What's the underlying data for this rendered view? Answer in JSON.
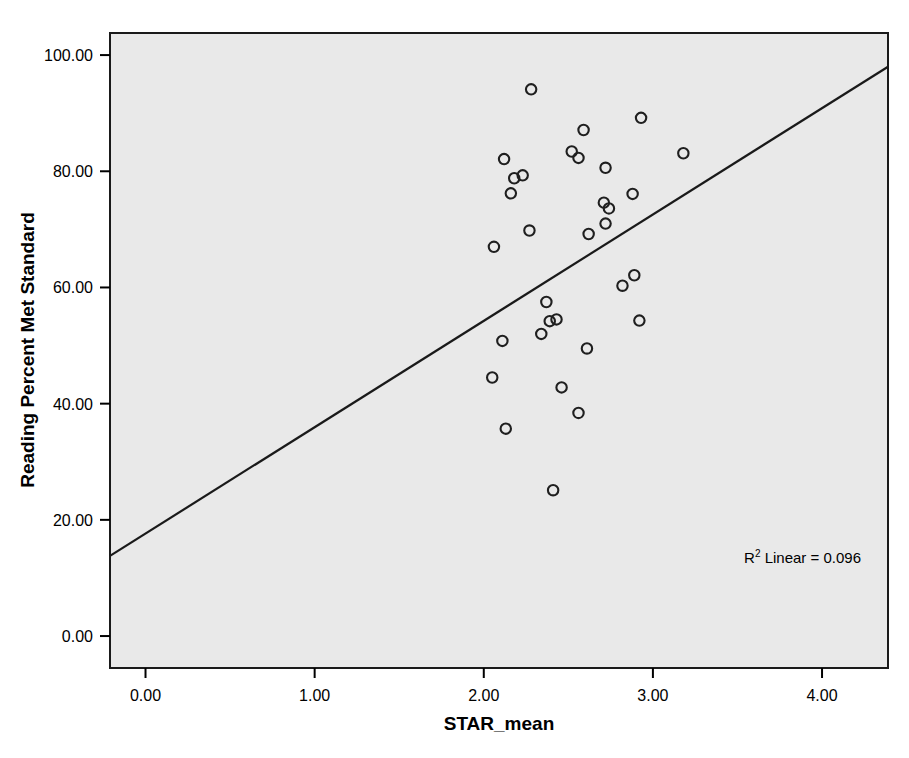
{
  "chart_data": {
    "type": "scatter",
    "title": "",
    "xlabel": "STAR_mean",
    "ylabel": "Reading Percent Met Standard",
    "xlim": [
      -0.21,
      4.39
    ],
    "ylim": [
      -5.5,
      103.8
    ],
    "xticks": [
      "0.00",
      "1.00",
      "2.00",
      "3.00",
      "4.00"
    ],
    "xtick_values": [
      0,
      1,
      2,
      3,
      4
    ],
    "yticks": [
      "0.00",
      "20.00",
      "40.00",
      "60.00",
      "80.00",
      "100.00"
    ],
    "ytick_values": [
      0,
      20,
      40,
      60,
      80,
      100
    ],
    "grid": false,
    "legend": false,
    "annotation": "R² Linear = 0.096",
    "annotation_base": "R",
    "annotation_sup": "2",
    "annotation_rest": " Linear = 0.096",
    "r_squared": 0.096,
    "marker_style": "open-circle",
    "plot_background": "#e9e9e9",
    "marker_color": "#1f1f1f",
    "fitline_color": "#1a1a1a",
    "fit_line": {
      "x0": -0.21,
      "y0": 13.8,
      "x1": 4.39,
      "y1": 98.0,
      "slope": 18.3,
      "intercept": 17.6
    },
    "points": [
      {
        "x": 2.28,
        "y": 94.1
      },
      {
        "x": 2.59,
        "y": 87.1
      },
      {
        "x": 2.93,
        "y": 89.2
      },
      {
        "x": 2.52,
        "y": 83.4
      },
      {
        "x": 2.56,
        "y": 82.3
      },
      {
        "x": 2.12,
        "y": 82.1
      },
      {
        "x": 3.18,
        "y": 83.1
      },
      {
        "x": 2.72,
        "y": 80.6
      },
      {
        "x": 2.18,
        "y": 78.8
      },
      {
        "x": 2.23,
        "y": 79.3
      },
      {
        "x": 2.16,
        "y": 76.2
      },
      {
        "x": 2.88,
        "y": 76.1
      },
      {
        "x": 2.71,
        "y": 74.6
      },
      {
        "x": 2.74,
        "y": 73.6
      },
      {
        "x": 2.72,
        "y": 71.0
      },
      {
        "x": 2.27,
        "y": 69.8
      },
      {
        "x": 2.62,
        "y": 69.2
      },
      {
        "x": 2.06,
        "y": 67.0
      },
      {
        "x": 2.82,
        "y": 60.3
      },
      {
        "x": 2.89,
        "y": 62.1
      },
      {
        "x": 2.37,
        "y": 57.5
      },
      {
        "x": 2.43,
        "y": 54.5
      },
      {
        "x": 2.39,
        "y": 54.2
      },
      {
        "x": 2.92,
        "y": 54.3
      },
      {
        "x": 2.34,
        "y": 52.0
      },
      {
        "x": 2.11,
        "y": 50.8
      },
      {
        "x": 2.61,
        "y": 49.5
      },
      {
        "x": 2.05,
        "y": 44.5
      },
      {
        "x": 2.46,
        "y": 42.8
      },
      {
        "x": 2.56,
        "y": 38.4
      },
      {
        "x": 2.13,
        "y": 35.7
      },
      {
        "x": 2.41,
        "y": 25.1
      }
    ]
  }
}
